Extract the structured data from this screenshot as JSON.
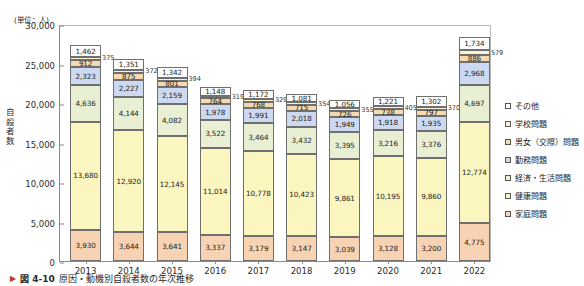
{
  "figure": {
    "unit_note": "(単位：人)",
    "y_axis_title": "自殺者数",
    "caption_marker": "▶",
    "caption_number": "図 4-10",
    "caption_text": "原因・動機別自殺者数の年次推移"
  },
  "legend": {
    "items": [
      {
        "label": "その他",
        "color": "#ffffff"
      },
      {
        "label": "学校問題",
        "color": "#fdf1d2"
      },
      {
        "label": "男女（交際）問題",
        "color": "#f5d9b0"
      },
      {
        "label": "勤務問題",
        "color": "#ccd9f0"
      },
      {
        "label": "経済・生活問題",
        "color": "#e9efd2"
      },
      {
        "label": "健康問題",
        "color": "#fbf5c0"
      },
      {
        "label": "家庭問題",
        "color": "#f7d3b3"
      }
    ]
  },
  "chart_data": {
    "type": "bar",
    "stacked": true,
    "title": "原因・動機別自殺者数の年次推移",
    "xlabel": "",
    "ylabel": "自殺者数",
    "unit": "人",
    "ylim": [
      0,
      30000
    ],
    "ytick_labels": [
      "30,000",
      "25,000",
      "20,000",
      "15,000",
      "10,000",
      "5,000",
      "0"
    ],
    "ytick_values": [
      30000,
      25000,
      20000,
      15000,
      10000,
      5000,
      0
    ],
    "grid": false,
    "legend_position": "right",
    "categories": [
      "2013",
      "2014",
      "2015",
      "2016",
      "2017",
      "2018",
      "2019",
      "2020",
      "2021",
      "2022"
    ],
    "series": [
      {
        "name": "家庭問題",
        "color": "#f7d3b3",
        "values": [
          3930,
          3644,
          3641,
          3337,
          3179,
          3147,
          3039,
          3128,
          3200,
          4775
        ],
        "labels": [
          "3,930",
          "3,644",
          "3,641",
          "3,337",
          "3,179",
          "3,147",
          "3,039",
          "3,128",
          "3,200",
          "4,775"
        ]
      },
      {
        "name": "健康問題",
        "color": "#fbf5c0",
        "values": [
          13680,
          12920,
          12145,
          11014,
          10778,
          10423,
          9861,
          10195,
          9860,
          12774
        ],
        "labels": [
          "13,680",
          "12,920",
          "12,145",
          "11,014",
          "10,778",
          "10,423",
          "9,861",
          "10,195",
          "9,860",
          "12,774"
        ]
      },
      {
        "name": "経済・生活問題",
        "color": "#e9efd2",
        "values": [
          4636,
          4144,
          4082,
          3522,
          3464,
          3432,
          3395,
          3216,
          3376,
          4697
        ],
        "labels": [
          "4,636",
          "4,144",
          "4,082",
          "3,522",
          "3,464",
          "3,432",
          "3,395",
          "3,216",
          "3,376",
          "4,697"
        ]
      },
      {
        "name": "勤務問題",
        "color": "#ccd9f0",
        "values": [
          2323,
          2227,
          2159,
          1978,
          1991,
          2018,
          1949,
          1918,
          1935,
          2968
        ],
        "labels": [
          "2,323",
          "2,227",
          "2,159",
          "1,978",
          "1,991",
          "2,018",
          "1,949",
          "1,918",
          "1,935",
          "2,968"
        ]
      },
      {
        "name": "男女（交際）問題",
        "color": "#f5d9b0",
        "values": [
          912,
          875,
          801,
          764,
          768,
          715,
          726,
          738,
          797,
          886
        ],
        "labels": [
          "912",
          "875",
          "801",
          "764",
          "768",
          "715",
          "726",
          "738",
          "797",
          "886"
        ]
      },
      {
        "name": "学校問題",
        "color": "#fdf1d2",
        "values": [
          375,
          372,
          394,
          319,
          329,
          354,
          355,
          405,
          370,
          579
        ],
        "labels": [
          "375",
          "372",
          "394",
          "319",
          "329",
          "354",
          "355",
          "405",
          "370",
          "579"
        ]
      },
      {
        "name": "その他",
        "color": "#ffffff",
        "values": [
          1462,
          1351,
          1342,
          1148,
          1172,
          1081,
          1056,
          1221,
          1302,
          1734
        ],
        "labels": [
          "1,462",
          "1,351",
          "1,342",
          "1,148",
          "1,172",
          "1,081",
          "1,056",
          "1,221",
          "1,302",
          "1,734"
        ]
      }
    ]
  }
}
